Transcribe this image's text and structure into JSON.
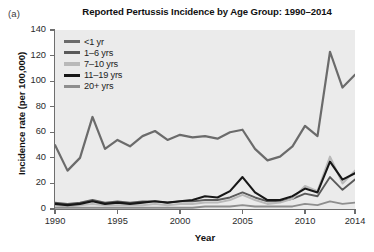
{
  "panel": {
    "label": "(a)"
  },
  "chart_data": {
    "type": "line",
    "title": "Reported Pertussis Incidence by Age Group: 1990–2014",
    "xlabel": "Year",
    "ylabel": "Incidence rate (per 100,000)",
    "xlim": [
      1990,
      2014
    ],
    "ylim": [
      0,
      140
    ],
    "ytick_values": [
      0,
      20,
      40,
      60,
      80,
      100,
      120,
      140
    ],
    "ytick_labels": [
      "0",
      "20",
      "40",
      "60",
      "80",
      "100",
      "120",
      "140"
    ],
    "xtick_values": [
      1990,
      1995,
      2000,
      2005,
      2010,
      2014
    ],
    "xtick_labels": [
      "1990",
      "1995",
      "2000",
      "2005",
      "2010",
      "2014"
    ],
    "grid": false,
    "legend_position": "top-left",
    "plot_background": "#ebebeb",
    "x": [
      1990,
      1991,
      1992,
      1993,
      1994,
      1995,
      1996,
      1997,
      1998,
      1999,
      2000,
      2001,
      2002,
      2003,
      2004,
      2005,
      2006,
      2007,
      2008,
      2009,
      2010,
      2011,
      2012,
      2013,
      2014
    ],
    "series": [
      {
        "name": "<1 yr",
        "color": "#6b6b6b",
        "width": 2.2,
        "values": [
          50,
          30,
          40,
          72,
          47,
          54,
          49,
          57,
          61,
          54,
          58,
          56,
          57,
          55,
          60,
          62,
          47,
          38,
          41,
          49,
          65,
          57,
          123,
          95,
          105
        ]
      },
      {
        "name": "1–6 yrs",
        "color": "#5a5a5a",
        "width": 1.9,
        "values": [
          5,
          4,
          5,
          7,
          5,
          6,
          5,
          6,
          6,
          5,
          6,
          6,
          7,
          7,
          9,
          13,
          9,
          6,
          6,
          8,
          12,
          10,
          25,
          15,
          23
        ]
      },
      {
        "name": "7–10 yrs",
        "color": "#b9b9b9",
        "width": 2.0,
        "values": [
          3,
          2,
          3,
          4,
          3,
          3,
          3,
          3,
          4,
          3,
          4,
          4,
          5,
          5,
          7,
          11,
          7,
          4,
          5,
          8,
          18,
          14,
          41,
          20,
          30
        ]
      },
      {
        "name": "11–19 yrs",
        "color": "#171717",
        "width": 2.1,
        "values": [
          4,
          3,
          4,
          6,
          4,
          5,
          4,
          5,
          6,
          5,
          6,
          7,
          10,
          9,
          14,
          25,
          13,
          7,
          7,
          10,
          16,
          13,
          37,
          23,
          28
        ]
      },
      {
        "name": "20+ yrs",
        "color": "#8e8e8e",
        "width": 1.9,
        "values": [
          1,
          1,
          1,
          1,
          1,
          1,
          1,
          1,
          1,
          1,
          1,
          1,
          2,
          2,
          2,
          3,
          2,
          2,
          2,
          2,
          4,
          3,
          6,
          4,
          5
        ]
      }
    ]
  }
}
